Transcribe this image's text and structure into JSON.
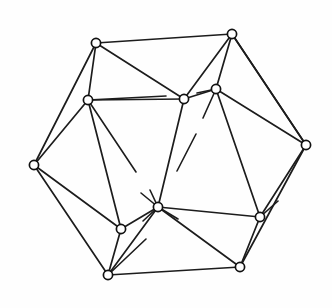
{
  "figure": {
    "title": "Icosahedron line drawing",
    "type": "polyhedron-graph",
    "background_color": "#fefefe",
    "line_color": "#1c1c1c",
    "vertex_fill": "#ffffff",
    "vertex_radius": 4.6,
    "canvas": {
      "width": 332,
      "height": 308
    },
    "vertices": [
      {
        "id": "v1",
        "name": "top-left-outer",
        "x": 96,
        "y": 43
      },
      {
        "id": "v2",
        "name": "top-right-outer",
        "x": 232,
        "y": 34
      },
      {
        "id": "v3",
        "name": "left-outer",
        "x": 34,
        "y": 165
      },
      {
        "id": "v4",
        "name": "right-outer",
        "x": 306,
        "y": 145
      },
      {
        "id": "v5",
        "name": "bottom-left-outer",
        "x": 108,
        "y": 275
      },
      {
        "id": "v6",
        "name": "bottom-right-outer",
        "x": 240,
        "y": 267
      },
      {
        "id": "v7",
        "name": "upper-left-inner",
        "x": 88,
        "y": 100
      },
      {
        "id": "v8",
        "name": "upper-center-inner",
        "x": 184,
        "y": 99
      },
      {
        "id": "v9",
        "name": "upper-right-inner",
        "x": 216,
        "y": 89
      },
      {
        "id": "v10",
        "name": "lower-left-inner",
        "x": 121,
        "y": 229
      },
      {
        "id": "v11",
        "name": "lower-center-inner",
        "x": 158,
        "y": 207
      },
      {
        "id": "v12",
        "name": "lower-right-inner",
        "x": 260,
        "y": 217
      }
    ],
    "edges": [
      {
        "from": "v1",
        "to": "v2"
      },
      {
        "from": "v1",
        "to": "v3"
      },
      {
        "from": "v1",
        "to": "v7"
      },
      {
        "from": "v1",
        "to": "v8"
      },
      {
        "from": "v2",
        "to": "v4"
      },
      {
        "from": "v2",
        "to": "v8"
      },
      {
        "from": "v2",
        "to": "v9"
      },
      {
        "from": "v3",
        "to": "v5"
      },
      {
        "from": "v3",
        "to": "v7"
      },
      {
        "from": "v3",
        "to": "v10"
      },
      {
        "from": "v4",
        "to": "v6"
      },
      {
        "from": "v4",
        "to": "v9"
      },
      {
        "from": "v4",
        "to": "v12"
      },
      {
        "from": "v5",
        "to": "v6"
      },
      {
        "from": "v5",
        "to": "v10"
      },
      {
        "from": "v6",
        "to": "v12"
      },
      {
        "from": "v7",
        "to": "v8"
      },
      {
        "from": "v7",
        "to": "v10"
      },
      {
        "from": "v8",
        "to": "v9"
      },
      {
        "from": "v8",
        "to": "v11"
      },
      {
        "from": "v9",
        "to": "v12"
      },
      {
        "from": "v10",
        "to": "v11"
      },
      {
        "from": "v11",
        "to": "v12"
      },
      {
        "from": "v5",
        "to": "v11"
      },
      {
        "from": "v6",
        "to": "v11"
      },
      {
        "from": "v4",
        "to": "v2"
      }
    ],
    "hidden_edge_stubs": [
      {
        "name": "stub-v7-right",
        "x1": 88,
        "y1": 100,
        "x2": 166,
        "y2": 96
      },
      {
        "name": "stub-v7-downright",
        "x1": 88,
        "y1": 100,
        "x2": 136,
        "y2": 172
      },
      {
        "name": "stub-v9-left",
        "x1": 216,
        "y1": 89,
        "x2": 197,
        "y2": 93
      },
      {
        "name": "stub-v9-downleft",
        "x1": 216,
        "y1": 89,
        "x2": 203,
        "y2": 118
      },
      {
        "name": "stub-v8-downright",
        "x1": 196,
        "y1": 134,
        "x2": 177,
        "y2": 171
      },
      {
        "name": "stub-v11-up",
        "x1": 158,
        "y1": 207,
        "x2": 150,
        "y2": 190
      },
      {
        "name": "stub-v11-upleft",
        "x1": 158,
        "y1": 207,
        "x2": 141,
        "y2": 193
      },
      {
        "name": "stub-v11-downleft",
        "x1": 158,
        "y1": 207,
        "x2": 143,
        "y2": 221
      },
      {
        "name": "stub-v11-downright",
        "x1": 158,
        "y1": 207,
        "x2": 178,
        "y2": 219
      },
      {
        "name": "stub-v5-upright",
        "x1": 108,
        "y1": 275,
        "x2": 146,
        "y2": 239
      },
      {
        "name": "stub-v12-upright",
        "x1": 260,
        "y1": 217,
        "x2": 278,
        "y2": 201
      }
    ]
  }
}
